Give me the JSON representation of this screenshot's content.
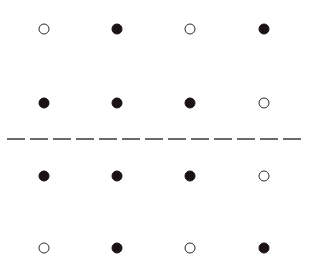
{
  "diagram": {
    "columns_x": [
      44,
      117,
      190,
      264
    ],
    "rows_y": [
      29,
      103,
      176,
      248
    ],
    "rows": [
      [
        "open",
        "filled",
        "open",
        "filled"
      ],
      [
        "filled",
        "filled",
        "filled",
        "open"
      ],
      [
        "filled",
        "filled",
        "filled",
        "open"
      ],
      [
        "open",
        "filled",
        "open",
        "filled"
      ]
    ],
    "divider": {
      "style": "dashed",
      "y": 140,
      "x_start": 7,
      "x_end": 301
    },
    "colors": {
      "filled": "#1a1214",
      "open_stroke": "#2a2a2a",
      "background": "#ffffff",
      "divider": "#3a3a3a"
    }
  }
}
